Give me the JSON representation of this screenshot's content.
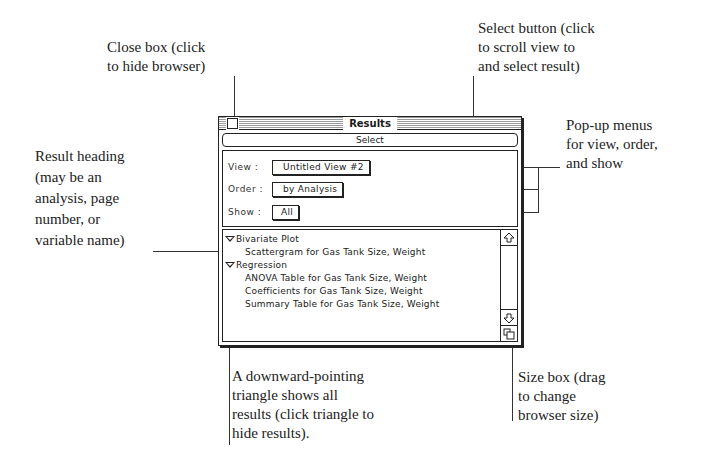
{
  "callouts": {
    "close_box": [
      "Close box (click",
      "to hide browser)"
    ],
    "select_button": [
      "Select button (click",
      "to scroll view to",
      "and select result)"
    ],
    "popup_menus": [
      "Pop-up menus",
      "for view, order,",
      "and show"
    ],
    "result_heading": [
      "Result heading",
      "(may be an",
      "analysis, page",
      "number, or",
      "variable name)"
    ],
    "triangle": [
      "A downward-pointing",
      "triangle shows all",
      "results (click triangle to",
      "hide results)."
    ],
    "size_box": [
      "Size box (drag",
      "to change",
      "browser size)"
    ]
  },
  "window": {
    "title": "Results",
    "select_label": "Select",
    "controls": {
      "view_label": "View :",
      "view_value": "Untitled View #2",
      "order_label": "Order :",
      "order_value": "by Analysis",
      "show_label": "Show :",
      "show_value": "All"
    },
    "results": [
      {
        "heading": "Bivariate Plot",
        "expanded": true,
        "items": [
          "Scattergram for Gas Tank Size, Weight"
        ]
      },
      {
        "heading": "Regression",
        "expanded": true,
        "items": [
          "ANOVA Table for Gas Tank Size, Weight",
          "Coefficients for Gas Tank Size, Weight",
          "Summary Table for Gas Tank Size, Weight"
        ]
      }
    ],
    "scrollbar": {
      "up_icon": "up-arrow-icon",
      "down_icon": "down-arrow-icon",
      "size_icon": "size-box-icon"
    }
  }
}
